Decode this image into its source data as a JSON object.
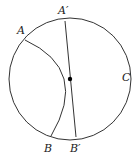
{
  "diagram": {
    "stroke_color": "#333333",
    "circle": {
      "cx": 70,
      "cy": 79,
      "r": 61
    },
    "chord": {
      "x1": 65,
      "y1": 21,
      "x2": 76,
      "y2": 137
    },
    "arc": {
      "d": "M 25 40 Q 90 70 51 136"
    },
    "center_point": {
      "cx": 70,
      "cy": 79,
      "r": 2.2
    },
    "labels": {
      "A_prime": "A′",
      "A": "A",
      "B": "B",
      "B_prime": "B′",
      "C": "C"
    }
  }
}
